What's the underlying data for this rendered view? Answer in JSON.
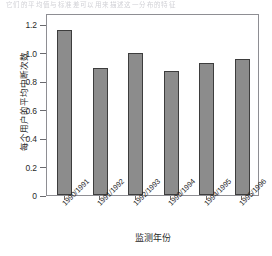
{
  "top_strip": {
    "text": "它们的平均值与标准差可以用来描述这一分布的特征"
  },
  "chart_data": {
    "type": "bar",
    "title": "",
    "xlabel": "监测年份",
    "ylabel": "每个用户的平均中断次数",
    "categories": [
      "1990/1991",
      "1991/1992",
      "1992/1993",
      "1993/1994",
      "1994/1995",
      "1995/1996"
    ],
    "values": [
      1.16,
      0.89,
      1.0,
      0.87,
      0.93,
      0.96
    ],
    "ylim": [
      0,
      1.28
    ],
    "yticks": [
      0,
      0.2,
      0.4,
      0.6,
      0.8,
      1.0,
      1.2
    ],
    "ytick_labels": [
      "0",
      "0.2",
      "0.4",
      "0.6",
      "0.8",
      "1.0",
      "1.2"
    ],
    "grid": false,
    "legend": null,
    "bar_color": "#8c8c8c",
    "bar_edge_color": "#3d3d3d",
    "frame_color": "#8e8e93",
    "background": "#ffffff"
  }
}
